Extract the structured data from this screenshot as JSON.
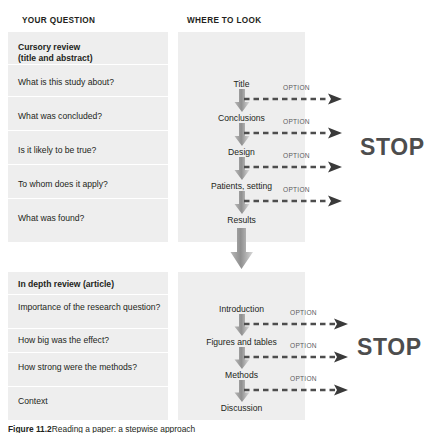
{
  "figure": {
    "headers": {
      "left": "YOUR QUESTION",
      "right": "WHERE TO LOOK"
    },
    "caption": "Figure 11.2",
    "caption_rest": "Reading a paper: a stepwise approach",
    "stop_label_1": "STOP",
    "stop_label_2": "STOP",
    "option_label": "OPTION",
    "colors": {
      "panel": "#eeeeee",
      "text": "#231f20",
      "arrow_dark": "#4d4d4d",
      "arrow_light": "#c9c9c9",
      "option_text": "#5b5b5b",
      "stop_text": "#4d4d4d",
      "separator": "#ffffff",
      "background": "#ffffff"
    }
  },
  "sections": [
    {
      "id": "cursory",
      "title": "Cursory review\n(title and abstract)",
      "title_line1": "Cursory review",
      "title_line2": "(title and abstract)",
      "questions": [
        "What is this study about?",
        "What was concluded?",
        "Is it likely to be true?",
        "To whom does it apply?",
        "What was found?"
      ],
      "steps": [
        "Title",
        "Conclusions",
        "Design",
        "Patients, setting",
        "Results"
      ],
      "options": [
        "OPTION",
        "OPTION",
        "OPTION",
        "OPTION"
      ],
      "stop": "STOP"
    },
    {
      "id": "indepth",
      "title": "In depth review (article)",
      "title_line1": "In depth review (article)",
      "title_line2": "",
      "questions": [
        "Importance of the research question?",
        "How big was the effect?",
        "How strong were the methods?",
        "Context"
      ],
      "steps": [
        "Introduction",
        "Figures and tables",
        "Methods",
        "Discussion"
      ],
      "options": [
        "OPTION",
        "OPTION",
        "OPTION"
      ],
      "stop": "STOP"
    }
  ]
}
